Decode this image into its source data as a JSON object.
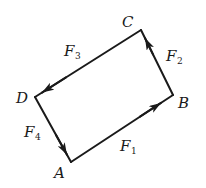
{
  "diagram": {
    "type": "force-vector-quadrilateral",
    "vertices": [
      {
        "id": "A",
        "label": "A",
        "x": 71,
        "y": 162
      },
      {
        "id": "B",
        "label": "B",
        "x": 173,
        "y": 95
      },
      {
        "id": "C",
        "label": "C",
        "x": 141,
        "y": 30
      },
      {
        "id": "D",
        "label": "D",
        "x": 35,
        "y": 97
      }
    ],
    "vectors": [
      {
        "id": "F1",
        "name": "F",
        "sub": "1",
        "from": "A",
        "to": "B"
      },
      {
        "id": "F2",
        "name": "F",
        "sub": "2",
        "from": "B",
        "to": "C"
      },
      {
        "id": "F3",
        "name": "F",
        "sub": "3",
        "from": "C",
        "to": "D"
      },
      {
        "id": "F4",
        "name": "F",
        "sub": "4",
        "from": "D",
        "to": "A"
      }
    ],
    "colors": {
      "stroke": "#1a1a1a",
      "background": "#ffffff"
    }
  }
}
